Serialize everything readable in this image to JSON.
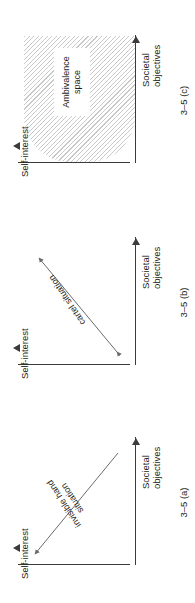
{
  "figure": {
    "axis_labels": {
      "self_interest": "Self-interest",
      "societal_objectives": "Societal\nobjectives"
    },
    "panels": [
      {
        "id": "a",
        "caption": "3–5 (a)",
        "relation_label": "invisible hand\nsituation",
        "arrow": {
          "type": "single-headed",
          "direction": "up-left",
          "from": [
            128,
            100
          ],
          "to": [
            26,
            16
          ]
        },
        "region": null
      },
      {
        "id": "b",
        "caption": "3–5 (b)",
        "relation_label": "cartel situation",
        "arrow": {
          "type": "double-headed",
          "direction": "up-right",
          "from": [
            28,
            100
          ],
          "to": [
            124,
            20
          ]
        },
        "region": null
      },
      {
        "id": "c",
        "caption": "3–5 (c)",
        "relation_label": null,
        "arrow": null,
        "region": {
          "name": "Ambivalence\nspace",
          "fill": "hatched-diagonal",
          "hatch_color": "#c9c9c9"
        }
      }
    ],
    "colors": {
      "axis": "#3b3b3b",
      "text": "#231f20",
      "background": "#ffffff",
      "hatch": "#c9c9c9"
    }
  }
}
